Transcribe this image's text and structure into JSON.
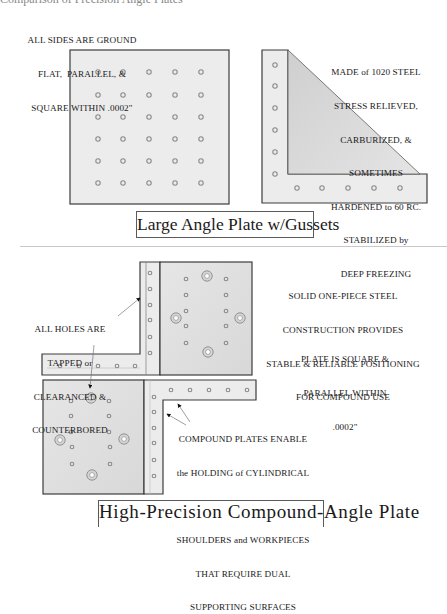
{
  "top_cutoff_text": "Comparison of Precision Angle Plates",
  "section1": {
    "notes": {
      "ground_flat": [
        "ALL SIDES ARE GROUND",
        "FLAT,  PARALLEL, &",
        "SQUARE WITHIN .0002\""
      ],
      "material": [
        "MADE of 1020 STEEL",
        "STRESS RELIEVED,",
        "CARBURIZED, &",
        "SOMETIMES",
        "HARDENED to 60 RC.",
        "STABILIZED by",
        "DEEP FREEZING"
      ]
    },
    "caption": "Large Angle Plate w/Gussets",
    "large_plate": {
      "hole_columns": 5,
      "hole_rows": 6
    },
    "angle_plate": {
      "vertical_holes": 6,
      "horizontal_holes": 5
    }
  },
  "section2": {
    "notes": {
      "holes": [
        "ALL HOLES ARE",
        "TAPPED or",
        "CLEARANCED &",
        "COUNTERBORED"
      ],
      "solid": [
        "SOLID ONE-PIECE STEEL",
        "CONSTRUCTION PROVIDES",
        "STABLE & RELIABLE POSITIONING",
        "FOR COMPOUND USE"
      ],
      "square": [
        "PLATE IS SQUARE &",
        "PARALLEL WITHIN",
        ".0002\""
      ],
      "compound": [
        "COMPOUND PLATES ENABLE",
        "the HOLDING of CYLINDRICAL",
        "PARTS WITH or WITHOUT",
        "SHOULDERS and WORKPIECES",
        "THAT REQUIRE DUAL",
        "SUPPORTING SURFACES"
      ]
    },
    "caption": "High-Precision Compound-Angle Plate"
  },
  "colors": {
    "plate_fill": "#ebebeb",
    "plate_face_fill": "#e2e2e2",
    "gusset_fill": "#d9d9d9",
    "outline": "#3c3c3c",
    "hole": "#8a8a8a",
    "counterbore": "#9a9a9a"
  }
}
